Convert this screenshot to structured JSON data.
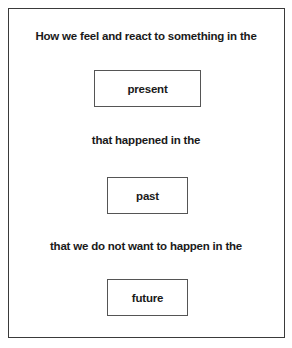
{
  "diagram": {
    "lines": [
      "How we feel and react to something in the",
      "that happened in the",
      "that we do not want to happen in the"
    ],
    "boxes": [
      "present",
      "past",
      "future"
    ],
    "colors": {
      "text": "#1a1a1a",
      "border": "#3a3a3a",
      "background": "#ffffff"
    }
  }
}
